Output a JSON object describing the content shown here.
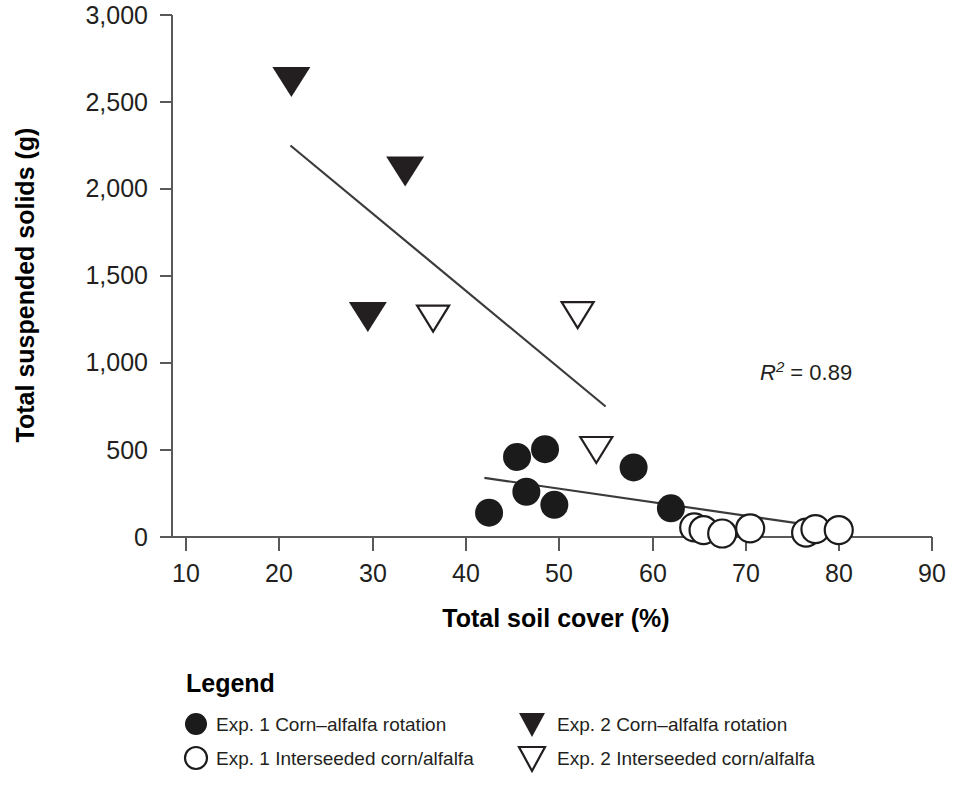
{
  "chart_data": {
    "type": "scatter",
    "title": "",
    "xlabel": "Total soil cover (%)",
    "ylabel": "Total suspended solids (g)",
    "xlim": [
      10,
      90
    ],
    "ylim": [
      0,
      3000
    ],
    "xticks": [
      "10",
      "20",
      "30",
      "40",
      "50",
      "60",
      "70",
      "80",
      "90"
    ],
    "yticks": [
      "0",
      "500",
      "1,000",
      "1,500",
      "2,000",
      "2,500",
      "3,000"
    ],
    "grid": false,
    "annotations": [
      {
        "name": "r-squared",
        "prefix": "R",
        "superscript": "2",
        "suffix": " = 0.89",
        "text": "R2 = 0.89"
      }
    ],
    "legend": {
      "title": "Legend",
      "position": "below-axes",
      "entries": [
        {
          "marker": "filled-circle",
          "label": "Exp. 1 Corn–alfalfa rotation"
        },
        {
          "marker": "open-circle",
          "label": "Exp. 1 Interseeded corn/alfalfa"
        },
        {
          "marker": "filled-triangle-down",
          "label": "Exp. 2 Corn–alfalfa rotation"
        },
        {
          "marker": "open-triangle-down",
          "label": "Exp. 2 Interseeded corn/alfalfa"
        }
      ]
    },
    "series": [
      {
        "name": "Exp. 1 Corn–alfalfa rotation",
        "marker": "filled-circle",
        "color": "#1b1b1b",
        "points": [
          {
            "x": 42.5,
            "y": 140
          },
          {
            "x": 45.5,
            "y": 460
          },
          {
            "x": 46.5,
            "y": 260
          },
          {
            "x": 48.5,
            "y": 505
          },
          {
            "x": 49.5,
            "y": 185
          },
          {
            "x": 58.0,
            "y": 400
          },
          {
            "x": 62.0,
            "y": 165
          }
        ]
      },
      {
        "name": "Exp. 1 Interseeded corn/alfalfa",
        "marker": "open-circle",
        "color": "#ffffff",
        "points": [
          {
            "x": 64.5,
            "y": 55
          },
          {
            "x": 65.5,
            "y": 40
          },
          {
            "x": 67.5,
            "y": 20
          },
          {
            "x": 70.5,
            "y": 50
          },
          {
            "x": 76.5,
            "y": 25
          },
          {
            "x": 77.5,
            "y": 45
          },
          {
            "x": 80.0,
            "y": 40
          }
        ]
      },
      {
        "name": "Exp. 2 Corn–alfalfa rotation",
        "marker": "filled-triangle-down",
        "color": "#231f20",
        "points": [
          {
            "x": 21.3,
            "y": 2615
          },
          {
            "x": 29.5,
            "y": 1265
          },
          {
            "x": 33.5,
            "y": 2100
          }
        ]
      },
      {
        "name": "Exp. 2 Interseeded corn/alfalfa",
        "marker": "open-triangle-down",
        "color": "#ffffff",
        "points": [
          {
            "x": 36.5,
            "y": 1255
          },
          {
            "x": 52.0,
            "y": 1275
          },
          {
            "x": 54.0,
            "y": 500
          }
        ]
      }
    ],
    "trendlines": [
      {
        "name": "exp1-trendline",
        "x0": 42.0,
        "y0": 340,
        "x1": 80.0,
        "y1": 45
      },
      {
        "name": "exp2-trendline",
        "x0": 21.2,
        "y0": 2250,
        "x1": 55.0,
        "y1": 750
      }
    ]
  }
}
